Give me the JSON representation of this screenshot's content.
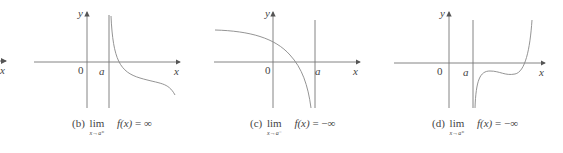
{
  "figure": {
    "panel_a_partial": {
      "x_label": "x"
    },
    "panels": [
      {
        "id": "b",
        "origin_label": "0",
        "a_label": "a",
        "x_label": "x",
        "y_label": "y",
        "caption_prefix": "(b)",
        "caption_lim": "lim",
        "caption_sub": "x→a⁺",
        "caption_fx": "f(x)",
        "caption_rhs": "= ∞"
      },
      {
        "id": "c",
        "origin_label": "0",
        "a_label": "a",
        "x_label": "x",
        "y_label": "y",
        "caption_prefix": "(c)",
        "caption_lim": "lim",
        "caption_sub": "x→a⁻",
        "caption_fx": "f(x)",
        "caption_rhs": "= −∞"
      },
      {
        "id": "d",
        "origin_label": "0",
        "a_label": "a",
        "x_label": "x",
        "y_label": "y",
        "caption_prefix": "(d)",
        "caption_lim": "lim",
        "caption_sub": "x→a⁺",
        "caption_fx": "f(x)",
        "caption_rhs": "= −∞"
      }
    ]
  }
}
